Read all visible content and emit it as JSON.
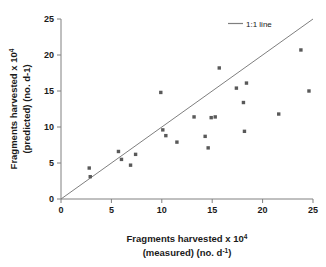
{
  "chart_data": {
    "type": "scatter",
    "title": "",
    "xlabel_line1": "Fragments harvested x 10",
    "xlabel_line1_sup": "4",
    "xlabel_line2_pre": "(measured) (no. d",
    "xlabel_line2_sup": "-1",
    "xlabel_line2_post": ")",
    "ylabel_line1": "Fragments harvested x 10",
    "ylabel_line1_sup": "4",
    "ylabel_line2": "(predicted) (no. d-1)",
    "xlabel": "Fragments harvested x 10^4 (measured) (no. d^-1)",
    "ylabel": "Fragments harvested x 10^4 (predicted) (no. d-1)",
    "xlim": [
      0,
      25
    ],
    "ylim": [
      0,
      25
    ],
    "xticks": [
      0,
      5,
      10,
      15,
      20,
      25
    ],
    "yticks": [
      0,
      5,
      10,
      15,
      20,
      25
    ],
    "xtick_labels": [
      "0",
      "5",
      "10",
      "15",
      "20",
      "25"
    ],
    "ytick_labels": [
      "0",
      "5",
      "10",
      "15",
      "20",
      "25"
    ],
    "grid": false,
    "legend_position": "top-right",
    "series": [
      {
        "name": "data points",
        "marker": "square",
        "color": "#595959",
        "points": [
          [
            2.8,
            4.3
          ],
          [
            2.9,
            3.1
          ],
          [
            5.7,
            6.6
          ],
          [
            6.0,
            5.5
          ],
          [
            6.9,
            4.7
          ],
          [
            7.4,
            6.2
          ],
          [
            9.9,
            14.8
          ],
          [
            10.1,
            9.6
          ],
          [
            10.4,
            8.8
          ],
          [
            11.5,
            7.9
          ],
          [
            13.2,
            11.4
          ],
          [
            14.3,
            8.7
          ],
          [
            14.6,
            7.1
          ],
          [
            14.9,
            11.3
          ],
          [
            15.3,
            11.4
          ],
          [
            15.7,
            18.2
          ],
          [
            17.4,
            15.4
          ],
          [
            18.1,
            13.4
          ],
          [
            18.2,
            9.4
          ],
          [
            18.4,
            16.1
          ],
          [
            21.6,
            11.8
          ],
          [
            23.8,
            20.7
          ],
          [
            24.6,
            15.0
          ]
        ]
      }
    ],
    "reference_line": {
      "label": "1:1 line",
      "color": "#7f7f7f",
      "from": [
        0,
        0
      ],
      "to": [
        25,
        25
      ]
    }
  },
  "legend": {
    "entries": [
      {
        "label": "1:1 line",
        "color": "#7f7f7f",
        "type": "line"
      }
    ]
  },
  "colors": {
    "axis": "#808080",
    "marker": "#595959",
    "line": "#7f7f7f",
    "text": "#1a1a1a",
    "background": "#ffffff"
  }
}
